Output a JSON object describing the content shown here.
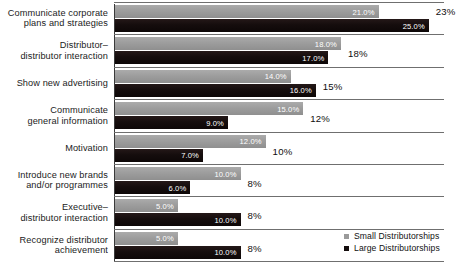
{
  "chart_data": {
    "type": "bar",
    "title": "",
    "subtitle": "",
    "xlabel": "",
    "ylabel": "",
    "orientation": "horizontal",
    "grid": false,
    "legend_position": "bottom-right",
    "xlim": [
      0,
      27
    ],
    "categories": [
      "Communicate corporate plans and strategies",
      "Distributor–distributor interaction",
      "Show new advertising",
      "Communicate general information",
      "Motivation",
      "Introduce new brands and/or programmes",
      "Executive–distributor interaction",
      "Recognize distributor achievement"
    ],
    "category_lines": [
      [
        "Communicate corporate",
        "plans and strategies"
      ],
      [
        "Distributor–",
        "distributor interaction"
      ],
      [
        "Show new advertising"
      ],
      [
        "Communicate",
        "general information"
      ],
      [
        "Motivation"
      ],
      [
        "Introduce new brands",
        "and/or programmes"
      ],
      [
        "Executive–",
        "distributor interaction"
      ],
      [
        "Recognize distributor",
        "achievement"
      ]
    ],
    "series": [
      {
        "name": "Small Distributorships",
        "color": "#9a9a9a",
        "values": [
          21.0,
          18.0,
          14.0,
          15.0,
          12.0,
          10.0,
          5.0,
          5.0
        ],
        "labels": [
          "21.0%",
          "18.0%",
          "14.0%",
          "15.0%",
          "12.0%",
          "10.0%",
          "5.0%",
          "5.0%"
        ]
      },
      {
        "name": "Large Distributorships",
        "color": "#140d0d",
        "values": [
          25.0,
          17.0,
          16.0,
          9.0,
          7.0,
          6.0,
          10.0,
          10.0
        ],
        "labels": [
          "25.0%",
          "17.0%",
          "16.0%",
          "9.0%",
          "7.0%",
          "6.0%",
          "10.0%",
          "10.0%"
        ]
      }
    ],
    "totals": [
      "23%",
      "18%",
      "15%",
      "12%",
      "10%",
      "8%",
      "8%",
      "8%"
    ]
  },
  "legend": {
    "items": [
      {
        "label": "Small Distributorships",
        "swatch": "small"
      },
      {
        "label": "Large Distributorships",
        "swatch": "large"
      }
    ]
  }
}
